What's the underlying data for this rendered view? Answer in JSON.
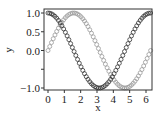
{
  "chart_data": {
    "type": "scatter",
    "title": "",
    "xlabel": "x",
    "ylabel": "y",
    "xlim": [
      -0.25,
      6.45
    ],
    "ylim": [
      -1.08,
      1.08
    ],
    "x_ticks": [
      0,
      1,
      2,
      3,
      4,
      5,
      6
    ],
    "x_tick_labels": [
      "0",
      "1",
      "2",
      "3",
      "4",
      "5",
      "6"
    ],
    "y_ticks": [
      -1.0,
      -0.5,
      0.0,
      0.5,
      1.0
    ],
    "y_tick_labels": [
      "−1.0",
      "",
      "0.0",
      "0.5",
      "1.0"
    ],
    "grid": false,
    "legend": null,
    "n_points": 60,
    "x_range": [
      0,
      6.2832
    ],
    "series": [
      {
        "name": "cos(x)",
        "function": "cos",
        "marker": "open-circle",
        "color": "#333333"
      },
      {
        "name": "sin(x)",
        "function": "sin",
        "marker": "open-circle",
        "color": "#9a9a9a"
      }
    ]
  }
}
